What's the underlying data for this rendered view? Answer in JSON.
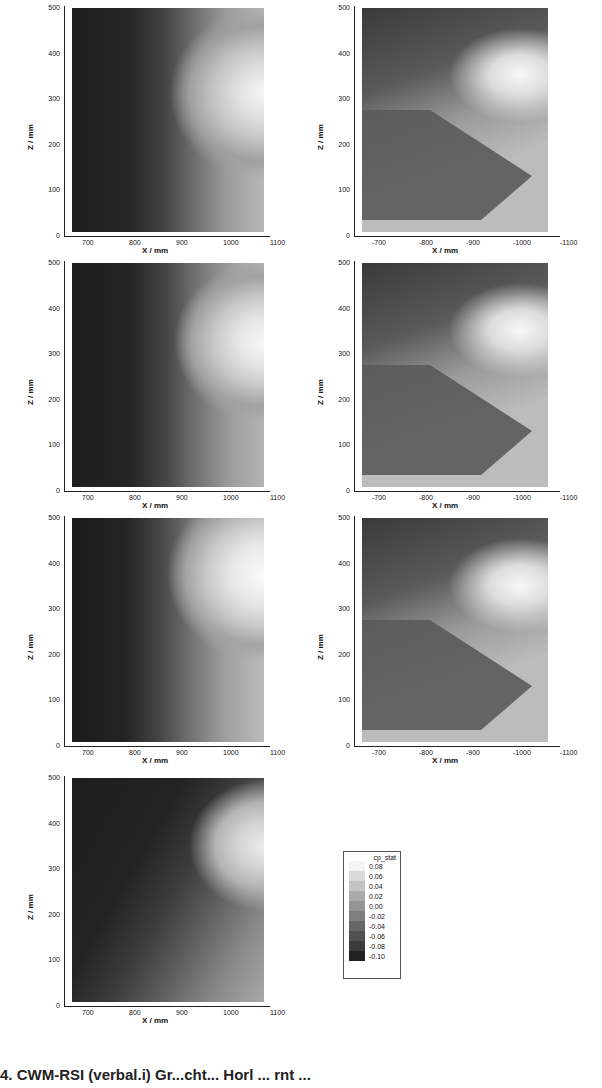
{
  "chart_data": {
    "type": "heatmap",
    "layout": "4 rows x 2 columns of contour plots (bottom-right empty, contains legend)",
    "colormap": "grayscale",
    "legend": {
      "title": "cp_stat",
      "levels": [
        "0.08",
        "0.06",
        "0.04",
        "0.02",
        "0.00",
        "-0.02",
        "-0.04",
        "-0.06",
        "-0.08",
        "-0.10"
      ],
      "colors": [
        "#f4f4f4",
        "#d9d9d9",
        "#c4c4c4",
        "#ababab",
        "#959595",
        "#7e7e7e",
        "#676767",
        "#515151",
        "#3b3b3b",
        "#222222"
      ]
    },
    "panels": [
      {
        "id": "left-1",
        "xlabel": "X / mm",
        "ylabel": "Z / mm",
        "xticks": [
          "700",
          "800",
          "900",
          "1000",
          "1100"
        ],
        "yticks": [
          "0",
          "100",
          "200",
          "300",
          "400",
          "500"
        ],
        "xlim": [
          650,
          1100
        ],
        "ylim": [
          0,
          500
        ]
      },
      {
        "id": "right-1",
        "xlabel": "X / mm",
        "ylabel": "Z / mm",
        "xticks": [
          "-700",
          "-800",
          "-900",
          "-1000",
          "-1100"
        ],
        "yticks": [
          "0",
          "100",
          "200",
          "300",
          "400",
          "500"
        ],
        "xlim": [
          -650,
          -1100
        ],
        "ylim": [
          0,
          500
        ]
      },
      {
        "id": "left-2",
        "xlabel": "X / mm",
        "ylabel": "Z / mm",
        "xticks": [
          "700",
          "800",
          "900",
          "1000",
          "1100"
        ],
        "yticks": [
          "0",
          "100",
          "200",
          "300",
          "400",
          "500"
        ],
        "xlim": [
          650,
          1100
        ],
        "ylim": [
          0,
          500
        ]
      },
      {
        "id": "right-2",
        "xlabel": "X / mm",
        "ylabel": "Z / mm",
        "xticks": [
          "-700",
          "-800",
          "-900",
          "-1000",
          "-1100"
        ],
        "yticks": [
          "0",
          "100",
          "200",
          "300",
          "400",
          "500"
        ],
        "xlim": [
          -650,
          -1100
        ],
        "ylim": [
          0,
          500
        ]
      },
      {
        "id": "left-3",
        "xlabel": "X / mm",
        "ylabel": "Z / mm",
        "xticks": [
          "700",
          "800",
          "900",
          "1000",
          "1100"
        ],
        "yticks": [
          "0",
          "100",
          "200",
          "300",
          "400",
          "500"
        ],
        "xlim": [
          650,
          1100
        ],
        "ylim": [
          0,
          500
        ]
      },
      {
        "id": "right-3",
        "xlabel": "X / mm",
        "ylabel": "Z / mm",
        "xticks": [
          "-700",
          "-800",
          "-900",
          "-1000",
          "-1100"
        ],
        "yticks": [
          "0",
          "100",
          "200",
          "300",
          "400",
          "500"
        ],
        "xlim": [
          -650,
          -1100
        ],
        "ylim": [
          0,
          500
        ]
      },
      {
        "id": "left-4",
        "xlabel": "X / mm",
        "ylabel": "Z / mm",
        "xticks": [
          "700",
          "800",
          "900",
          "1000",
          "1100"
        ],
        "yticks": [
          "0",
          "100",
          "200",
          "300",
          "400",
          "500"
        ],
        "xlim": [
          650,
          1100
        ],
        "ylim": [
          0,
          500
        ]
      }
    ]
  },
  "axis": {
    "xlabel": "X / mm",
    "ylabel": "Z / mm",
    "yticks": [
      "0",
      "100",
      "200",
      "300",
      "400",
      "500"
    ],
    "xticks_left": [
      "700",
      "800",
      "900",
      "1000",
      "1100"
    ],
    "xticks_right": [
      "-700",
      "-800",
      "-900",
      "-1000",
      "-1100"
    ]
  },
  "caption": "4. CWM-RSI (verbal.i) Gr...cht... Horl ... rnt ..."
}
